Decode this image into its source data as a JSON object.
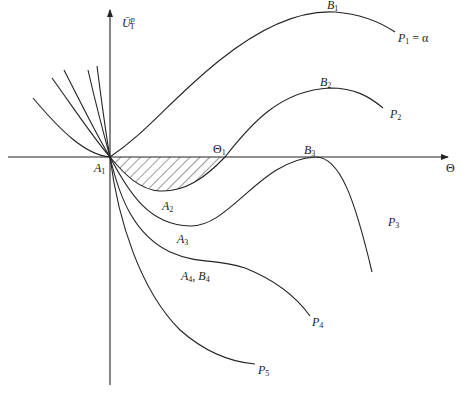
{
  "figure": {
    "axes": {
      "x_label": "Θ",
      "y_label_main": "Ū",
      "y_label_sub": "T",
      "y_label_sup": "p",
      "origin_label": "A",
      "origin_sub": "1"
    },
    "curves": [
      {
        "id": "P1",
        "label": "P",
        "sub": "1",
        "suffix": " = α",
        "extremum_label": "B",
        "extremum_sub": "1"
      },
      {
        "id": "P2",
        "label": "P",
        "sub": "2",
        "extremum_label": "B",
        "extremum_sub": "2",
        "crossing_label": "Θ",
        "crossing_sub": "1",
        "min_label": "A",
        "min_sub": "2"
      },
      {
        "id": "P3",
        "label": "P",
        "sub": "3",
        "extremum_label": "B",
        "extremum_sub": "3",
        "min_label": "A",
        "min_sub": "3"
      },
      {
        "id": "P4",
        "label": "P",
        "sub": "4",
        "inflection_label": "A",
        "inflection_sub": "4",
        "inflection_label2": "B",
        "inflection_sub2": "4"
      },
      {
        "id": "P5",
        "label": "P",
        "sub": "5"
      }
    ],
    "shaded_region": "hatched area between P2 and Θ-axis from A1 to Θ1",
    "colors": {
      "line": "#222222",
      "background": "#ffffff"
    }
  }
}
